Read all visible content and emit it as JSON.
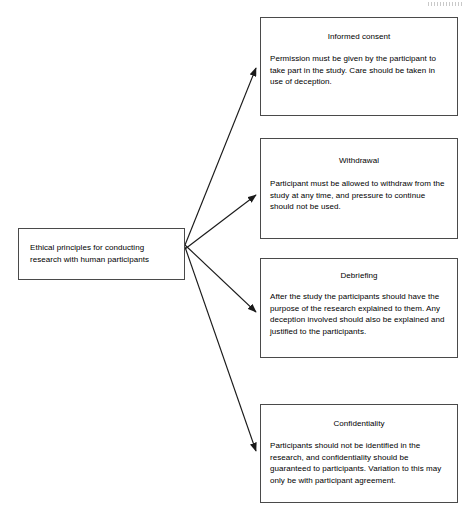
{
  "diagram": {
    "source": {
      "text": "Ethical principles for conducting research with human participants"
    },
    "principles": [
      {
        "title": "Informed consent",
        "body": "Permission must be given by the participant to take part in the study. Care should be taken in use of deception."
      },
      {
        "title": "Withdrawal",
        "body": "Participant must be allowed to withdraw from the study at any time, and pressure to continue should not be used."
      },
      {
        "title": "Debriefing",
        "body": "After the study the participants should have the purpose of the research explained to them. Any deception involved should also be explained and justified to the participants."
      },
      {
        "title": "Confidentiality",
        "body": "Participants should not be identified in the research, and confidentiality should be guaranteed to participants. Variation to this may only be with participant agreement."
      }
    ],
    "colors": {
      "background": "#ffffff",
      "text": "#000000",
      "border": "#4a4a4a",
      "connector": "#1a1a1a"
    }
  }
}
